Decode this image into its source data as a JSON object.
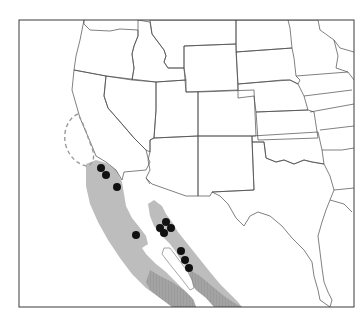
{
  "map": {
    "title": "",
    "region": "Southwestern North America",
    "colors": {
      "background": "#ffffff",
      "state_lines": "#4a4a4a",
      "range_primary": "#bdbdbd",
      "range_secondary": "#9e9e9e",
      "historic_range_outline": "#9a9a9a",
      "occurrence_points": "#111111"
    },
    "layers": [
      {
        "name": "state-boundaries",
        "style": "thin black lines"
      },
      {
        "name": "species-range",
        "style": "light gray fill"
      },
      {
        "name": "species-range-southern",
        "style": "darker stippled gray fill"
      },
      {
        "name": "historic-range",
        "style": "dashed gray outline"
      },
      {
        "name": "occurrence-sites",
        "style": "black filled circles"
      }
    ],
    "occurrence_points": [
      {
        "x": 101,
        "y": 168
      },
      {
        "x": 106,
        "y": 175
      },
      {
        "x": 117,
        "y": 187
      },
      {
        "x": 136,
        "y": 235
      },
      {
        "x": 166,
        "y": 222
      },
      {
        "x": 160,
        "y": 228
      },
      {
        "x": 171,
        "y": 228
      },
      {
        "x": 164,
        "y": 233
      },
      {
        "x": 181,
        "y": 251
      },
      {
        "x": 185,
        "y": 260
      },
      {
        "x": 189,
        "y": 268
      }
    ],
    "occurrence_count": "11"
  }
}
